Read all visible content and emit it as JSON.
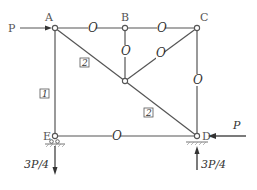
{
  "nodes": {
    "A": {
      "label": "A"
    },
    "B": {
      "label": "B"
    },
    "C": {
      "label": "C"
    },
    "D": {
      "label": "D"
    },
    "E": {
      "label": "E"
    }
  },
  "members": {
    "AB": "O",
    "BC": "O",
    "B_center": "O",
    "C_center": "O",
    "CD": "O",
    "ED": "O",
    "AE": "1",
    "A_center": "2",
    "center_D": "2"
  },
  "loads": {
    "at_A": "P",
    "at_D_horizontal": "P",
    "reaction_E": "3P/4",
    "reaction_D": "3P/4"
  },
  "colors": {
    "line": "#555555",
    "text": "#333333"
  }
}
